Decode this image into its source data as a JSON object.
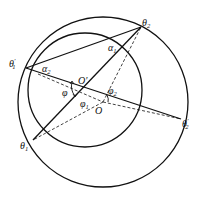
{
  "diagram": {
    "outer_circle": {
      "cx": 103,
      "cy": 102,
      "r": 85
    },
    "inner_circle": {
      "cx": 85,
      "cy": 90,
      "r": 57
    },
    "points": {
      "theta2": {
        "x": 141,
        "y": 27
      },
      "theta1_prime": {
        "x": 26,
        "y": 68
      },
      "theta1": {
        "x": 33,
        "y": 140
      },
      "theta2_prime": {
        "x": 181,
        "y": 119
      },
      "O_prime": {
        "x": 85,
        "y": 90
      },
      "O": {
        "x": 103,
        "y": 102
      }
    },
    "labels": {
      "theta2": {
        "base": "θ",
        "sub": "2"
      },
      "theta1_prime": {
        "base": "θ",
        "sub": "1",
        "sup": "′"
      },
      "theta1": {
        "base": "θ",
        "sub": "1"
      },
      "theta2_prime": {
        "base": "θ",
        "sub": "2",
        "sup": "′"
      },
      "alpha1": {
        "base": "α",
        "sub": "1"
      },
      "alpha2": {
        "base": "α",
        "sub": "2"
      },
      "O_prime": {
        "base": "O′"
      },
      "O": {
        "base": "O"
      },
      "phi": {
        "base": "φ"
      },
      "phi1": {
        "base": "φ",
        "sub": "1"
      },
      "phi2": {
        "base": "φ",
        "sub": "2"
      }
    },
    "colors": {
      "stroke": "#111111",
      "background": "#ffffff"
    }
  }
}
